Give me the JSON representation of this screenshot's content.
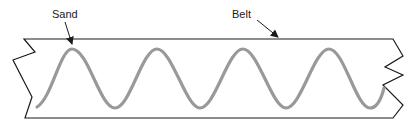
{
  "diagram": {
    "type": "belt-cross-section",
    "labels": {
      "sand": "Sand",
      "belt": "Belt"
    },
    "colors": {
      "outline": "#1a1a1a",
      "sand_wave": "#999999",
      "background": "#ffffff"
    },
    "wave": {
      "peaks": 4,
      "troughs": 4
    }
  }
}
